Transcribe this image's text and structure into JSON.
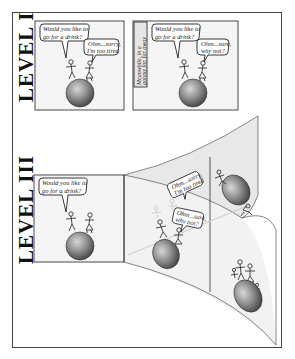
{
  "levels": [
    {
      "label": "LEVEL I"
    },
    {
      "label": "LEVEL III"
    }
  ],
  "level1": {
    "panel1": {
      "bubble_a": [
        "Would you like to",
        "go for a drink?"
      ],
      "bubble_b": [
        "Ohm...sorry,",
        "I'm too tired"
      ]
    },
    "panel2": {
      "caption": [
        "Meanwhile, in a",
        "galaxy far, far away"
      ],
      "bubble_a": [
        "Would you like to",
        "go for a drink?"
      ],
      "bubble_b": [
        "Ohm...sure,",
        "why not?"
      ]
    }
  },
  "level3": {
    "panel1": {
      "bubble_a": [
        "Would you like to",
        "go for a drink?"
      ]
    },
    "branch_upper": {
      "bubble_b": [
        "Ohm...sorry,",
        "I'm too tired"
      ]
    },
    "branch_lower": {
      "bubble_b": [
        "Ohm...sure,",
        "why not?"
      ]
    }
  },
  "colors": {
    "frame": "#444444",
    "panel_bg": "#f5f5f5",
    "sheet_bg": "#ececec",
    "globe": "#8a8a8a"
  }
}
